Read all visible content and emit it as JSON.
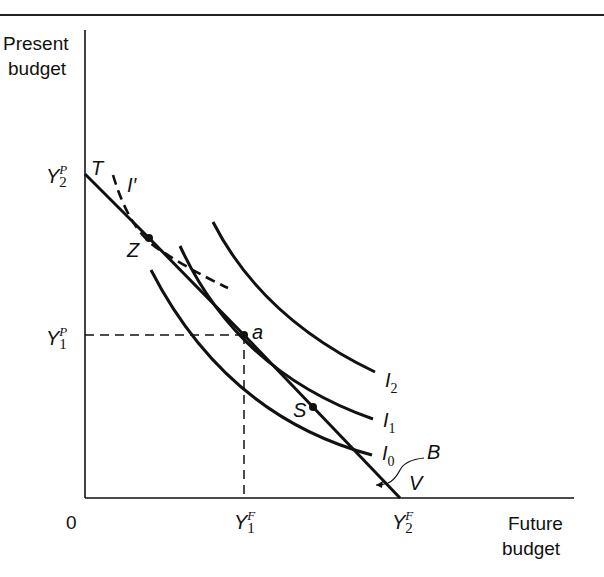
{
  "diagram": {
    "y_axis_title": [
      "Present",
      "budget"
    ],
    "x_axis_title": [
      "Future",
      "budget"
    ],
    "origin_label": "0",
    "y_ticks": [
      {
        "base": "Y",
        "sup": "P",
        "sub": "2"
      },
      {
        "base": "Y",
        "sup": "P",
        "sub": "1"
      }
    ],
    "x_ticks": [
      {
        "base": "Y",
        "sup": "F",
        "sub": "1"
      },
      {
        "base": "Y",
        "sup": "F",
        "sub": "2"
      }
    ],
    "point_labels": {
      "T": "T",
      "Z": "Z",
      "a": "a",
      "S": "S",
      "V": "V",
      "B": "B"
    },
    "curve_labels": [
      {
        "base": "I",
        "sub": "2"
      },
      {
        "base": "I",
        "sub": "1"
      },
      {
        "base": "I",
        "sub": "0"
      }
    ],
    "dashed_curve_label": "I′",
    "colors": {
      "ink": "#111111",
      "background": "#ffffff"
    }
  }
}
